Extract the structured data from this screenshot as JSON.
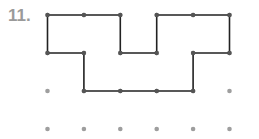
{
  "problem": {
    "number_label": "11."
  },
  "grid": {
    "columns": 6,
    "rows": 4,
    "origin_x": 47.5,
    "origin_y": 15,
    "spacing_x": 36.4,
    "spacing_y": 38,
    "dot_color": "#9e9e9e",
    "dot_radius": 2.3
  },
  "shape": {
    "stroke_color": "#222222",
    "vertex_color": "#555555",
    "stroke_width": 1.6,
    "vertices": [
      [
        0,
        0
      ],
      [
        1,
        0
      ],
      [
        2,
        0
      ],
      [
        2,
        1
      ],
      [
        3,
        1
      ],
      [
        3,
        0
      ],
      [
        4,
        0
      ],
      [
        5,
        0
      ],
      [
        5,
        1
      ],
      [
        4,
        1
      ],
      [
        4,
        2
      ],
      [
        3,
        2
      ],
      [
        2,
        2
      ],
      [
        1,
        2
      ],
      [
        1,
        1
      ],
      [
        0,
        1
      ]
    ]
  }
}
